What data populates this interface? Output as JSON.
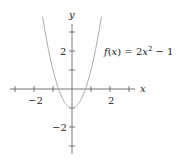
{
  "chart_data": {
    "type": "line",
    "title": "",
    "xlabel": "x",
    "ylabel": "y",
    "xlim": [
      -3.3,
      3.3
    ],
    "ylim": [
      -3.3,
      3.3
    ],
    "x_ticks": [
      -3,
      -2,
      -1,
      0,
      1,
      2,
      3
    ],
    "y_ticks": [
      -3,
      -2,
      -1,
      0,
      1,
      2,
      3
    ],
    "x_tick_labels": {
      "-2": "−2",
      "2": "2"
    },
    "y_tick_labels": {
      "-2": "−2",
      "2": "2"
    },
    "grid": false,
    "series": [
      {
        "name": "f(x) = 2x^2 − 1",
        "expression": "2*x^2 - 1",
        "color": "#aaaaaa",
        "x_range": [
          -1.55,
          1.55
        ]
      }
    ],
    "annotations": [
      {
        "text": "f(x) = 2x² − 1",
        "x": 1.5,
        "y": 2
      }
    ]
  },
  "labels": {
    "x_axis": "x",
    "y_axis": "y",
    "x_neg2": "−2",
    "x_pos2": "2",
    "y_pos2": "2",
    "y_neg2": "−2",
    "func_f": "f",
    "func_x": "x",
    "func_rest": ") = 2",
    "func_x2": "x",
    "func_exp": "2",
    "func_tail": " − 1"
  }
}
